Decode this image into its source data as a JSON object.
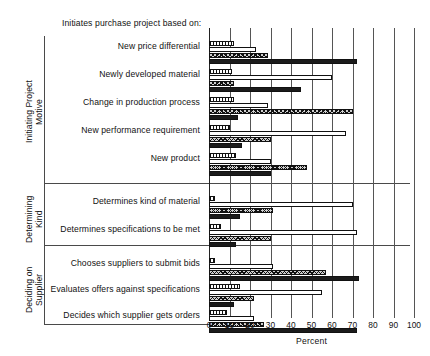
{
  "header": {
    "title": "Initiates purchase project based on:"
  },
  "axis": {
    "xlabel": "Percent",
    "ticks": [
      "0",
      "10",
      "20",
      "30",
      "40",
      "50",
      "60",
      "70",
      "80",
      "90",
      "100"
    ],
    "xmin": 0,
    "xmax": 100
  },
  "sections": [
    {
      "title_lines": "Initiating Project\nMotive"
    },
    {
      "title_lines": "Determining\nKind"
    },
    {
      "title_lines": "Deciding on\nSupplier"
    }
  ],
  "row_labels": [
    "New price differential",
    "Newly developed material",
    "Change in production process",
    "New performance requirement",
    "New product",
    "Determines kind of material",
    "Determines specifications to be met",
    "Chooses suppliers to submit bids",
    "Evaluates offers against specifications",
    "Decides which supplier gets orders"
  ],
  "chart_data": {
    "type": "bar",
    "orientation": "horizontal",
    "title": "Initiates purchase project based on:",
    "xlabel": "Percent",
    "ylabel": "",
    "xlim": [
      0,
      100
    ],
    "grid": true,
    "legend": "none",
    "categories": [
      "New price differential",
      "Newly developed material",
      "Change in production process",
      "New performance requirement",
      "New product",
      "Determines kind of material",
      "Determines specifications to be met",
      "Chooses suppliers to submit bids",
      "Evaluates offers against specifications",
      "Decides which supplier gets orders"
    ],
    "series": [
      {
        "name": "series-1",
        "pattern": "hatch",
        "values": [
          12,
          11,
          12,
          10,
          13,
          3,
          6,
          3,
          15,
          9
        ]
      },
      {
        "name": "series-2",
        "pattern": "white",
        "values": [
          23,
          60,
          29,
          67,
          30,
          70,
          72,
          31,
          55,
          22
        ]
      },
      {
        "name": "series-3",
        "pattern": "cross",
        "values": [
          29,
          12,
          70,
          30,
          48,
          31,
          30,
          57,
          22,
          27
        ]
      },
      {
        "name": "series-4",
        "pattern": "dark",
        "values": [
          72,
          45,
          14,
          16,
          30,
          15,
          13,
          73,
          12,
          72
        ]
      }
    ]
  }
}
